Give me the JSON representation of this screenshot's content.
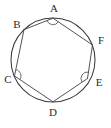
{
  "figure": {
    "type": "geometry-diagram",
    "background_color": "#ffffff",
    "stroke_color": "#3a3a3a",
    "label_color": "#2b2b2b",
    "width": 111,
    "height": 128
  },
  "circle": {
    "name": "circumscribed-circle",
    "center_x": 53,
    "center_y": 60,
    "radius": 42
  },
  "vertices": [
    {
      "label": "A",
      "x": 53.0,
      "y": 18.2,
      "label_x": 54,
      "label_y": 9,
      "angle_marked": true
    },
    {
      "label": "B",
      "x": 24.0,
      "y": 29.6,
      "label_x": 17,
      "label_y": 25,
      "angle_marked": false
    },
    {
      "label": "C",
      "x": 14.5,
      "y": 76.0,
      "label_x": 8,
      "label_y": 80,
      "angle_marked": true
    },
    {
      "label": "D",
      "x": 53.0,
      "y": 101.8,
      "label_x": 53,
      "label_y": 113,
      "angle_marked": false
    },
    {
      "label": "E",
      "x": 87.5,
      "y": 78.5,
      "label_x": 99,
      "label_y": 83,
      "angle_marked": true
    },
    {
      "label": "F",
      "x": 92.5,
      "y": 45.0,
      "label_x": 101,
      "label_y": 41,
      "angle_marked": false
    }
  ],
  "edges": [
    {
      "from": "A",
      "to": "B"
    },
    {
      "from": "B",
      "to": "C"
    },
    {
      "from": "C",
      "to": "D"
    },
    {
      "from": "D",
      "to": "E"
    },
    {
      "from": "E",
      "to": "F"
    },
    {
      "from": "F",
      "to": "A"
    }
  ],
  "angle_arcs": [
    {
      "at": "A",
      "radius": 6.5
    },
    {
      "at": "C",
      "radius": 6.5
    },
    {
      "at": "E",
      "radius": 6.5
    }
  ]
}
